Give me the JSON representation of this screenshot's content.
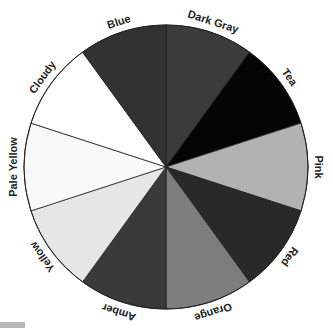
{
  "wheel": {
    "center": [
      166,
      167
    ],
    "radius": 142,
    "label_radius": 152,
    "segments": [
      {
        "label": "Dark Gray",
        "color": "#3b3b3b"
      },
      {
        "label": "Tea",
        "color": "#050505"
      },
      {
        "label": "Pink",
        "color": "#b2b2b2"
      },
      {
        "label": "Red",
        "color": "#292929"
      },
      {
        "label": "Orange",
        "color": "#7d7d7d"
      },
      {
        "label": "Amber",
        "color": "#3a3a3a"
      },
      {
        "label": "Yellow",
        "color": "#e6e6e6"
      },
      {
        "label": "Pale Yellow",
        "color": "#f8f8f8"
      },
      {
        "label": "Cloudy",
        "color": "#ffffff"
      },
      {
        "label": "Blue",
        "color": "#323232"
      }
    ]
  }
}
